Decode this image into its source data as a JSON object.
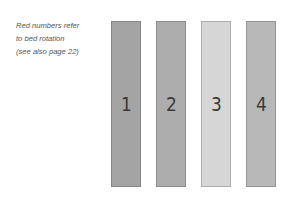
{
  "note": {
    "lines": [
      "Red numbers refer",
      "to bed rotation",
      "(see also page 22)"
    ]
  },
  "beds": [
    {
      "label": "1",
      "color": "#a4a4a4"
    },
    {
      "label": "2",
      "color": "#adadad"
    },
    {
      "label": "3",
      "color": "#d6d6d6"
    },
    {
      "label": "4",
      "color": "#b8b8b8"
    }
  ]
}
